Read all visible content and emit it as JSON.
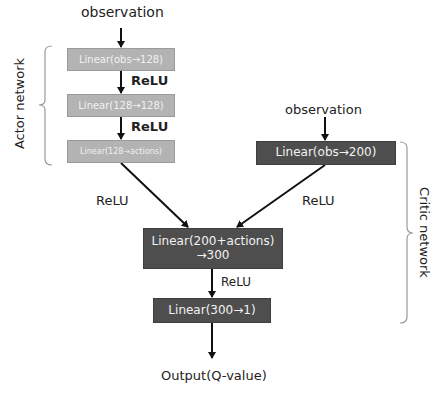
{
  "diagram": {
    "inputs": {
      "actor_observation": "observation",
      "critic_observation": "observation"
    },
    "actor": {
      "group_label": "Actor network",
      "layers": [
        {
          "label": "Linear(obs→128)"
        },
        {
          "label": "Linear(128→128)"
        },
        {
          "label": "Linear(128→actions)"
        }
      ],
      "activations": [
        "ReLU",
        "ReLU"
      ],
      "output_activation": "ReLU"
    },
    "critic": {
      "group_label": "Critic network",
      "obs_layer": {
        "label": "Linear(obs→200)"
      },
      "obs_activation": "ReLU",
      "combined_layer": {
        "line1": "Linear(200+actions)",
        "line2": "→300"
      },
      "combined_activation": "ReLU",
      "final_layer": {
        "label": "Linear(300→1)"
      }
    },
    "output": "Output(Q-value)",
    "colors": {
      "actor_box": "#b3b3b3",
      "critic_box": "#4e4e4e",
      "arrow": "#111111",
      "bracket": "#9a9a9a"
    }
  }
}
